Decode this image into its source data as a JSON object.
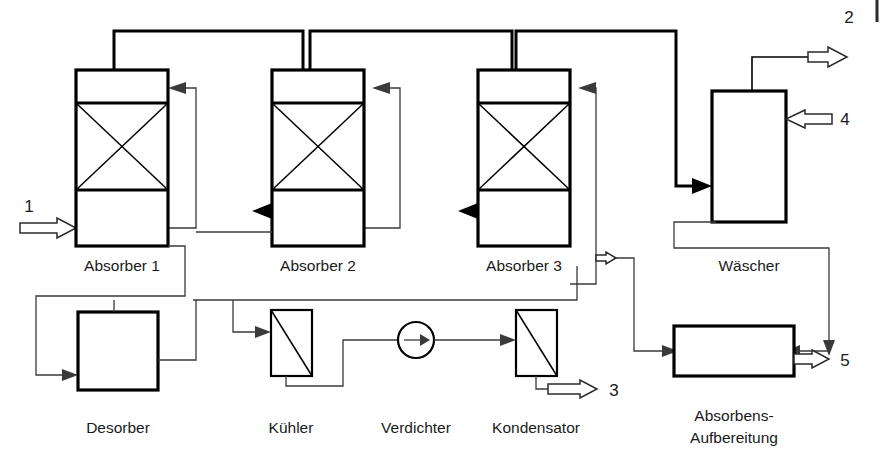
{
  "diagram": {
    "language": "de",
    "equipment": [
      {
        "id": "absorber1",
        "label": "Absorber 1",
        "type": "packed-column",
        "x": 76,
        "y": 70,
        "w": 92,
        "h": 176,
        "label_x": 122,
        "label_y": 271
      },
      {
        "id": "absorber2",
        "label": "Absorber 2",
        "type": "packed-column",
        "x": 272,
        "y": 70,
        "w": 92,
        "h": 176,
        "label_x": 318,
        "label_y": 271
      },
      {
        "id": "absorber3",
        "label": "Absorber 3",
        "type": "packed-column",
        "x": 478,
        "y": 70,
        "w": 92,
        "h": 176,
        "label_x": 524,
        "label_y": 271
      },
      {
        "id": "waescher",
        "label": "Wäscher",
        "type": "column",
        "x": 712,
        "y": 91,
        "w": 74,
        "h": 131,
        "label_x": 749,
        "label_y": 271
      },
      {
        "id": "desorber",
        "label": "Desorber",
        "type": "vessel",
        "x": 78,
        "y": 312,
        "w": 80,
        "h": 78,
        "label_x": 118,
        "label_y": 433
      },
      {
        "id": "kuehler",
        "label": "Kühler",
        "type": "heat-exchanger",
        "x": 271,
        "y": 310,
        "w": 41,
        "h": 66,
        "label_x": 291,
        "label_y": 433
      },
      {
        "id": "verdichter",
        "label": "Verdichter",
        "type": "compressor",
        "cx": 416,
        "cy": 340,
        "r": 18,
        "label_x": 416,
        "label_y": 433
      },
      {
        "id": "kondensator",
        "label": "Kondensator",
        "type": "heat-exchanger",
        "x": 516,
        "y": 310,
        "w": 41,
        "h": 66,
        "label_x": 536,
        "label_y": 433
      },
      {
        "id": "absorbens",
        "label_line1": "Absorbens-",
        "label_line2": "Aufbereitung",
        "type": "vessel",
        "x": 674,
        "y": 326,
        "w": 120,
        "h": 50,
        "label_x": 734,
        "label_y": 421
      }
    ],
    "streams": [
      {
        "number": "1",
        "role": "feed-gas-inlet",
        "x": 29,
        "y": 212
      },
      {
        "number": "2",
        "role": "clean-gas-outlet",
        "x": 849,
        "y": 23
      },
      {
        "number": "3",
        "role": "condensate-product",
        "x": 614,
        "y": 394
      },
      {
        "number": "4",
        "role": "wash-liquid-inlet",
        "x": 845,
        "y": 118
      },
      {
        "number": "5",
        "role": "waste-outlet",
        "x": 842,
        "y": 359
      }
    ]
  }
}
